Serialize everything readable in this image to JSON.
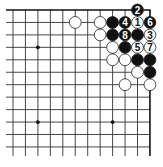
{
  "diagram": {
    "type": "go-board-partial",
    "corner": "top-right",
    "visible_columns": 12,
    "visible_rows": 12,
    "origin": {
      "x": 13,
      "y": 10
    },
    "spacing": 12.45,
    "colors": {
      "line": "#333333",
      "edge": "#111111",
      "black_stone": "#111111",
      "white_stone": "#ffffff",
      "stone_outline": "#222222",
      "black_label": "#ffffff",
      "white_label": "#111111"
    },
    "star_points": [
      {
        "col": 2,
        "row": 3
      },
      {
        "col": 2,
        "row": 9
      },
      {
        "col": 8,
        "row": 9
      }
    ],
    "stones": [
      {
        "col": 10,
        "row": 0,
        "color": "black",
        "label": "2"
      },
      {
        "col": 5,
        "row": 1,
        "color": "white",
        "label": ""
      },
      {
        "col": 7,
        "row": 1,
        "color": "white",
        "label": ""
      },
      {
        "col": 8,
        "row": 1,
        "color": "black",
        "label": ""
      },
      {
        "col": 9,
        "row": 1,
        "color": "black",
        "label": "4"
      },
      {
        "col": 10,
        "row": 1,
        "color": "white",
        "label": "1"
      },
      {
        "col": 11,
        "row": 1,
        "color": "black",
        "label": "6"
      },
      {
        "col": 7,
        "row": 2,
        "color": "white",
        "label": ""
      },
      {
        "col": 8,
        "row": 2,
        "color": "black",
        "label": ""
      },
      {
        "col": 9,
        "row": 2,
        "color": "black",
        "label": "8"
      },
      {
        "col": 10,
        "row": 2,
        "color": "black",
        "label": ""
      },
      {
        "col": 11,
        "row": 2,
        "color": "white",
        "label": "3"
      },
      {
        "col": 8,
        "row": 3,
        "color": "white",
        "label": ""
      },
      {
        "col": 9,
        "row": 3,
        "color": "black",
        "label": ""
      },
      {
        "col": 10,
        "row": 3,
        "color": "white",
        "label": "5"
      },
      {
        "col": 11,
        "row": 3,
        "color": "white",
        "label": "7"
      },
      {
        "col": 8,
        "row": 4,
        "color": "white",
        "label": ""
      },
      {
        "col": 9,
        "row": 4,
        "color": "white",
        "label": ""
      },
      {
        "col": 10,
        "row": 4,
        "color": "black",
        "label": ""
      },
      {
        "col": 11,
        "row": 4,
        "color": "black",
        "label": ""
      },
      {
        "col": 10,
        "row": 5,
        "color": "white",
        "label": ""
      },
      {
        "col": 11,
        "row": 5,
        "color": "black",
        "label": ""
      },
      {
        "col": 9,
        "row": 6,
        "color": "white",
        "label": ""
      },
      {
        "col": 11,
        "row": 6,
        "color": "white",
        "label": ""
      }
    ]
  }
}
